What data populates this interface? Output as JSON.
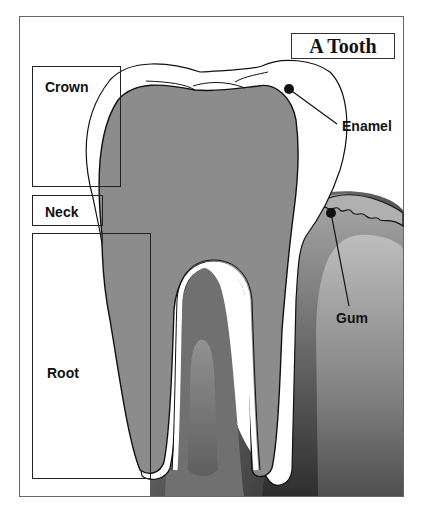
{
  "diagram": {
    "title": "A Tooth",
    "labels": {
      "crown": "Crown",
      "neck": "Neck",
      "root": "Root",
      "enamel": "Enamel",
      "gum": "Gum"
    },
    "colors": {
      "dentin": "#8c8c8c",
      "enamel": "#ffffff",
      "gum_outer": "#9a9a9a",
      "gum_inner": "#6e6e6e",
      "bone_light": "#b5b5b5",
      "bone_dark": "#3a3a3a",
      "outline": "#111111"
    }
  }
}
